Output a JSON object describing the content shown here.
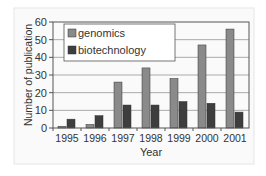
{
  "chart_data": {
    "type": "bar",
    "title": "",
    "xlabel": "Year",
    "ylabel": "Number of publication",
    "ylim": [
      0,
      60
    ],
    "yticks": [
      0,
      10,
      20,
      30,
      40,
      50,
      60
    ],
    "grid": true,
    "legend_position": "top-left inside",
    "categories": [
      "1995",
      "1996",
      "1997",
      "1998",
      "1999",
      "2000",
      "2001"
    ],
    "series": [
      {
        "name": "genomics",
        "color": "#8a8a8a",
        "values": [
          1,
          2,
          26,
          34,
          28,
          47,
          56
        ]
      },
      {
        "name": "biotechnology",
        "color": "#3e3e3e",
        "values": [
          5,
          7,
          13,
          13,
          15,
          14,
          9
        ]
      }
    ]
  }
}
